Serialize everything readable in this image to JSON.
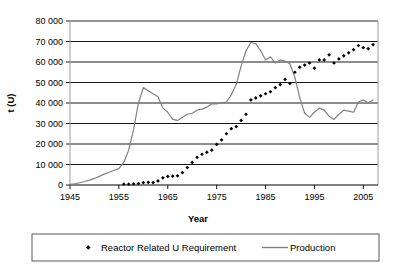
{
  "chart_data": {
    "type": "line",
    "title": "",
    "xlabel": "Year",
    "ylabel": "t (U)",
    "xlim": [
      1945,
      2008
    ],
    "ylim": [
      0,
      80000
    ],
    "grid": "horizontal",
    "legend_position": "bottom",
    "x_tick_labels": [
      "1945",
      "1955",
      "1965",
      "1975",
      "1985",
      "1995",
      "2005"
    ],
    "x_ticks": [
      1945,
      1955,
      1965,
      1975,
      1985,
      1995,
      2005
    ],
    "y_tick_labels": [
      "0",
      "10 000",
      "20 000",
      "30 000",
      "40 000",
      "50 000",
      "60 000",
      "70 000",
      "80 000"
    ],
    "y_ticks": [
      0,
      10000,
      20000,
      30000,
      40000,
      50000,
      60000,
      70000,
      80000
    ],
    "colors": {
      "production_line": "#808080",
      "requirement_marker": "#000000",
      "gridline": "#000000",
      "axis": "#808080",
      "plot_background": "#ffffff"
    },
    "series": [
      {
        "name": "Reactor Related U Requirement",
        "type": "scatter",
        "marker": "diamond",
        "color": "#000000",
        "x": [
          1956,
          1957,
          1958,
          1959,
          1960,
          1961,
          1962,
          1963,
          1964,
          1965,
          1966,
          1967,
          1968,
          1969,
          1970,
          1971,
          1972,
          1973,
          1974,
          1975,
          1976,
          1977,
          1978,
          1979,
          1980,
          1981,
          1982,
          1983,
          1984,
          1985,
          1986,
          1987,
          1988,
          1989,
          1990,
          1991,
          1992,
          1993,
          1994,
          1995,
          1996,
          1997,
          1998,
          1999,
          2000,
          2001,
          2002,
          2003,
          2004,
          2005,
          2006,
          2007
        ],
        "values": [
          400,
          400,
          500,
          700,
          1200,
          1300,
          1200,
          2000,
          3500,
          4200,
          4300,
          4500,
          6000,
          8500,
          11000,
          13500,
          15000,
          16000,
          17000,
          19800,
          22000,
          25000,
          27500,
          28500,
          31500,
          34500,
          41500,
          42500,
          43500,
          44500,
          45500,
          47500,
          49000,
          51500,
          49500,
          55000,
          57500,
          58500,
          59500,
          57000,
          61000,
          61000,
          63500,
          59500,
          61500,
          63000,
          64500,
          66000,
          68000,
          67000,
          66500,
          68500
        ]
      },
      {
        "name": "Production",
        "type": "line",
        "color": "#808080",
        "x": [
          1945,
          1946,
          1947,
          1948,
          1949,
          1950,
          1951,
          1952,
          1953,
          1954,
          1955,
          1956,
          1957,
          1958,
          1959,
          1960,
          1961,
          1962,
          1963,
          1964,
          1965,
          1966,
          1967,
          1968,
          1969,
          1970,
          1971,
          1972,
          1973,
          1974,
          1975,
          1976,
          1977,
          1978,
          1979,
          1980,
          1981,
          1982,
          1983,
          1984,
          1985,
          1986,
          1987,
          1988,
          1989,
          1990,
          1991,
          1992,
          1993,
          1994,
          1995,
          1996,
          1997,
          1998,
          1999,
          2000,
          2001,
          2002,
          2003,
          2004,
          2005,
          2006,
          2007
        ],
        "values": [
          300,
          600,
          1100,
          1700,
          2400,
          3200,
          4200,
          5300,
          6200,
          7200,
          8000,
          11000,
          17000,
          27000,
          40000,
          47500,
          46000,
          44500,
          43000,
          37500,
          35500,
          32000,
          31500,
          33000,
          34500,
          35000,
          36500,
          37000,
          38000,
          39500,
          39500,
          40000,
          40500,
          44000,
          49000,
          58000,
          65500,
          69500,
          69000,
          65500,
          61000,
          62500,
          59500,
          61000,
          60500,
          59000,
          52500,
          42500,
          35000,
          33000,
          35500,
          37500,
          36500,
          33500,
          32000,
          34500,
          36500,
          36000,
          35500,
          40500,
          41500,
          40000,
          41500
        ]
      }
    ]
  },
  "axes": {
    "ylabel": "t (U)",
    "xlabel": "Year"
  },
  "legend": {
    "items": [
      {
        "label": "Reactor Related U Requirement",
        "marker": "diamond-marker",
        "color": "#000000"
      },
      {
        "label": "Production",
        "marker": "line-swatch",
        "color": "#808080"
      }
    ]
  }
}
